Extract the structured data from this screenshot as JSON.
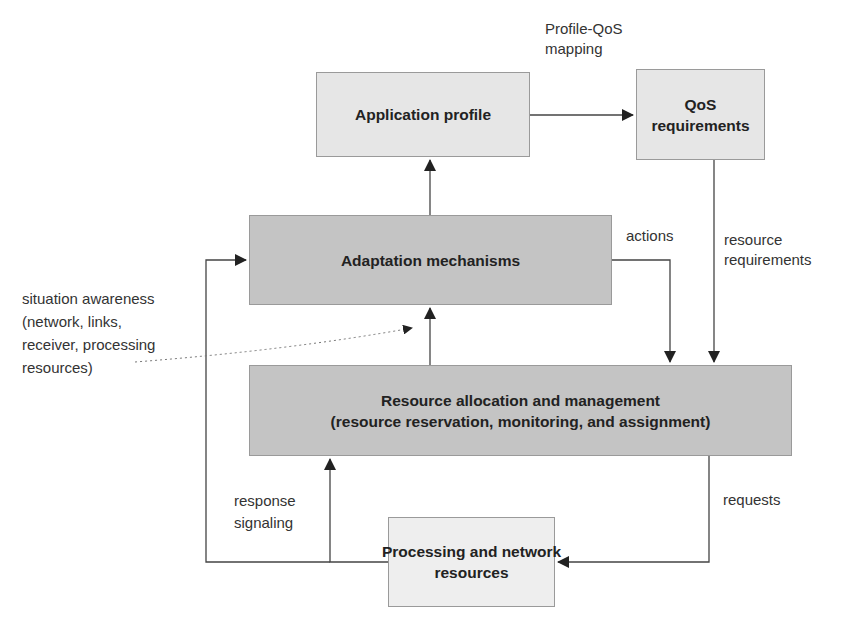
{
  "diagram": {
    "nodes": {
      "application_profile": {
        "label": "Application profile"
      },
      "qos_requirements": {
        "label": "QoS\nrequirements"
      },
      "adaptation_mechanisms": {
        "label": "Adaptation mechanisms"
      },
      "resource_allocation": {
        "label": "Resource allocation and management\n(resource reservation, monitoring, and assignment)"
      },
      "processing_resources": {
        "label": "Processing and network\nresources"
      }
    },
    "edge_labels": {
      "profile_qos_mapping": "Profile-QoS\nmapping",
      "actions": "actions",
      "resource_requirements": "resource\nrequirements",
      "situation_awareness": "situation awareness\n(network, links,\nreceiver, processing\nresources)",
      "response_signaling": "response\nsignaling",
      "requests": "requests"
    },
    "edges": [
      {
        "from": "application_profile",
        "to": "qos_requirements",
        "label": "Profile-QoS mapping"
      },
      {
        "from": "adaptation_mechanisms",
        "to": "application_profile",
        "label": ""
      },
      {
        "from": "qos_requirements",
        "to": "resource_allocation",
        "label": "resource requirements"
      },
      {
        "from": "adaptation_mechanisms",
        "to": "resource_allocation",
        "label": "actions"
      },
      {
        "from": "resource_allocation",
        "to": "adaptation_mechanisms",
        "label": ""
      },
      {
        "from": "resource_allocation",
        "to": "processing_resources",
        "label": "requests"
      },
      {
        "from": "processing_resources",
        "to": "resource_allocation",
        "label": "response signaling"
      },
      {
        "from": "processing_resources",
        "to": "adaptation_mechanisms",
        "label": ""
      },
      {
        "from": "situation_awareness",
        "to": "adaptation_mechanisms",
        "label": "",
        "style": "dotted"
      }
    ]
  }
}
